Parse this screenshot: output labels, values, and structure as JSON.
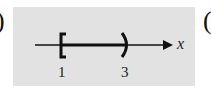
{
  "figure": {
    "left_fragment": ")",
    "right_fragment": "(",
    "number_line": {
      "variable": "x",
      "interval": {
        "left_endpoint": 1,
        "left_bracket": "[",
        "left_closed": true,
        "right_endpoint": 3,
        "right_bracket": ")",
        "right_closed": false
      },
      "tick_labels": [
        "1",
        "3"
      ]
    },
    "colors": {
      "panel": "#e2e2e2",
      "ink": "#111111"
    }
  }
}
